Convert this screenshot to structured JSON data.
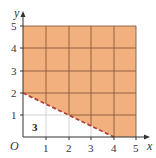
{
  "diagram": {
    "type": "inequality-region-graph",
    "x_axis": {
      "label": "x",
      "ticks": [
        "1",
        "2",
        "3",
        "4",
        "5"
      ],
      "range": [
        0,
        5
      ]
    },
    "y_axis": {
      "label": "y",
      "ticks": [
        "1",
        "2",
        "3",
        "4",
        "5"
      ],
      "range": [
        0,
        5
      ]
    },
    "origin_label": "O",
    "boundary_line": {
      "from": [
        0,
        2
      ],
      "to": [
        4,
        0
      ],
      "style": "dashed",
      "color": "#b0423a"
    },
    "shaded_region": {
      "description": "region above dashed line within 0≤x≤5, 0≤y≤5",
      "color": "#f2b07e"
    },
    "region_label": "3",
    "grid_color": "#8a5a3a"
  }
}
